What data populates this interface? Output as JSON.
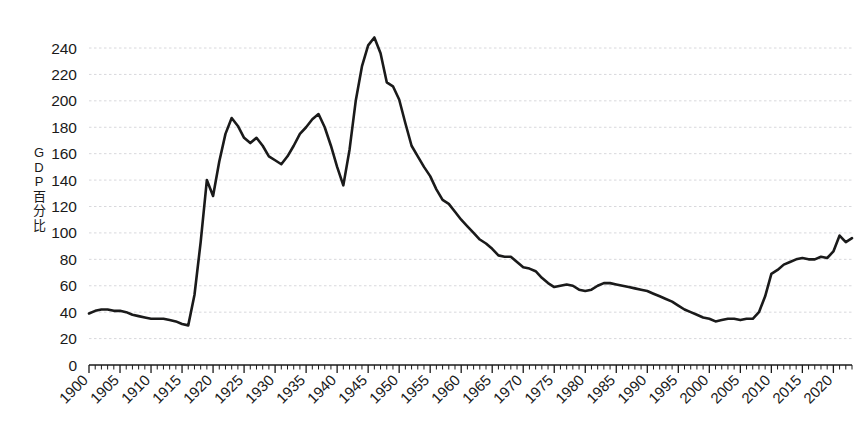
{
  "chart_data": {
    "type": "line",
    "title": "",
    "subtitle": "",
    "xlabel": "",
    "ylabel": "GDP百分比",
    "ylabel_chars": [
      "G",
      "D",
      "P",
      "百",
      "分",
      "比"
    ],
    "xlim": [
      1900,
      2023
    ],
    "ylim": [
      0,
      250
    ],
    "y_ticks": [
      0,
      20,
      40,
      60,
      80,
      100,
      120,
      140,
      160,
      180,
      200,
      220,
      240
    ],
    "x_ticks": [
      1900,
      1905,
      1910,
      1915,
      1920,
      1925,
      1930,
      1935,
      1940,
      1945,
      1950,
      1955,
      1960,
      1965,
      1970,
      1975,
      1980,
      1985,
      1990,
      1995,
      2000,
      2005,
      2010,
      2015,
      2020
    ],
    "x_tick_labels": [
      "1900",
      "1905",
      "1910",
      "1915",
      "1920",
      "1925",
      "1930",
      "1935",
      "1940",
      "1945",
      "1950",
      "1955",
      "1960",
      "1965",
      "1970",
      "1975",
      "1980",
      "1985",
      "1990",
      "1995",
      "2000",
      "2005",
      "2010",
      "2015",
      "2020"
    ],
    "x_minor_tick_step": 1,
    "grid": "horizontal-dotted",
    "grid_color": "#d8d8dc",
    "legend": "none",
    "line_color": "#1a1a1a",
    "line_width": 2.6,
    "annotations": [],
    "series": [
      {
        "name": "GDP百分比",
        "x": [
          1900,
          1901,
          1902,
          1903,
          1904,
          1905,
          1906,
          1907,
          1908,
          1909,
          1910,
          1911,
          1912,
          1913,
          1914,
          1915,
          1916,
          1917,
          1918,
          1919,
          1920,
          1921,
          1922,
          1923,
          1924,
          1925,
          1926,
          1927,
          1928,
          1929,
          1930,
          1931,
          1932,
          1933,
          1934,
          1935,
          1936,
          1937,
          1938,
          1939,
          1940,
          1941,
          1942,
          1943,
          1944,
          1945,
          1946,
          1947,
          1948,
          1949,
          1950,
          1951,
          1952,
          1953,
          1954,
          1955,
          1956,
          1957,
          1958,
          1959,
          1960,
          1961,
          1962,
          1963,
          1964,
          1965,
          1966,
          1967,
          1968,
          1969,
          1970,
          1971,
          1972,
          1973,
          1974,
          1975,
          1976,
          1977,
          1978,
          1979,
          1980,
          1981,
          1982,
          1983,
          1984,
          1985,
          1986,
          1987,
          1988,
          1989,
          1990,
          1991,
          1992,
          1993,
          1994,
          1995,
          1996,
          1997,
          1998,
          1999,
          2000,
          2001,
          2002,
          2003,
          2004,
          2005,
          2006,
          2007,
          2008,
          2009,
          2010,
          2011,
          2012,
          2013,
          2014,
          2015,
          2016,
          2017,
          2018,
          2019,
          2020,
          2021,
          2022,
          2023
        ],
        "values": [
          39,
          41,
          42,
          42,
          41,
          41,
          40,
          38,
          37,
          36,
          35,
          35,
          35,
          34,
          33,
          31,
          30,
          53,
          93,
          140,
          128,
          154,
          175,
          187,
          181,
          172,
          168,
          172,
          166,
          158,
          155,
          152,
          158,
          166,
          175,
          180,
          186,
          190,
          180,
          166,
          150,
          136,
          163,
          200,
          226,
          242,
          248,
          236,
          214,
          211,
          201,
          183,
          166,
          158,
          150,
          143,
          133,
          125,
          122,
          116,
          110,
          105,
          100,
          95,
          92,
          88,
          83,
          82,
          82,
          78,
          74,
          73,
          71,
          66,
          62,
          59,
          60,
          61,
          60,
          57,
          56,
          57,
          60,
          62,
          62,
          61,
          60,
          59,
          58,
          57,
          56,
          54,
          52,
          50,
          48,
          45,
          42,
          40,
          38,
          36,
          35,
          33,
          34,
          35,
          35,
          34,
          35,
          35,
          40,
          52,
          69,
          72,
          76,
          78,
          80,
          81,
          80,
          80,
          82,
          81,
          86,
          98,
          93,
          96
        ]
      }
    ]
  },
  "axis": {
    "y_tick_labels": [
      "240",
      "220",
      "200",
      "180",
      "160",
      "140",
      "120",
      "100",
      "80",
      "60",
      "40",
      "20",
      "0"
    ]
  }
}
